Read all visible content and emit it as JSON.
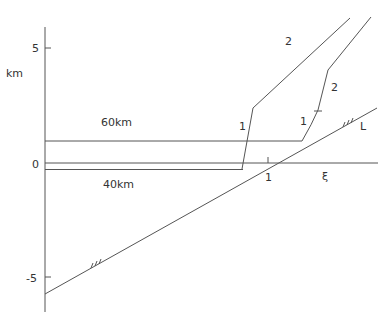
{
  "axes": {
    "y_unit_label": "km",
    "y_ticks": [
      {
        "label": "5",
        "y": 48
      },
      {
        "label": "0",
        "y": 164
      },
      {
        "label": "-5",
        "y": 277
      }
    ],
    "x_axis_label": "ξ",
    "x_tick": {
      "label": "1",
      "x": 268
    }
  },
  "labels": {
    "layer_upper": "60km",
    "layer_lower": "40km",
    "line_L": "L",
    "curve_left_lower": "1",
    "curve_left_upper": "2",
    "curve_right_lower": "1",
    "curve_right_upper": "2"
  },
  "colors": {
    "line": "#555555",
    "text": "#333333"
  }
}
